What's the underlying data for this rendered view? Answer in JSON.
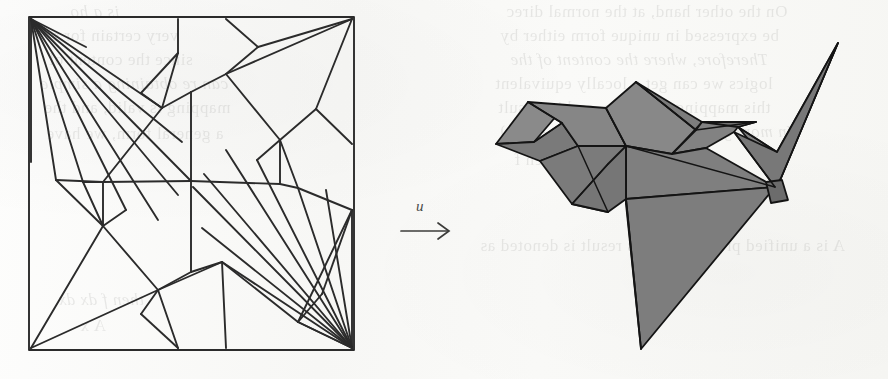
{
  "figure": {
    "kind": "origami-crease-pattern-and-folded-model",
    "caption": "",
    "arrow": {
      "label": "u",
      "direction": "right",
      "icon": "right-arrow-icon"
    },
    "colors": {
      "paper": "#fbfbfa",
      "crease_line": "#2b2b2b",
      "model_fill": "#7f7f7f",
      "model_fill_light": "#8c8c8c",
      "model_fill_dark": "#6f6f6f",
      "model_outline": "#141414",
      "ghost_text": "#5b5b58"
    },
    "left_panel": {
      "name": "crease-pattern",
      "shape": "square",
      "border_label": "paper boundary",
      "fan_vertices": [
        "top-left corner",
        "bottom-right corner"
      ],
      "fan_ray_count_top_left": 9,
      "fan_ray_count_bottom_right": 9,
      "viewbox": "0 0 331 339"
    },
    "right_panel": {
      "name": "folded-model",
      "subject": "flapping bird / crane",
      "facets_visible": 14,
      "viewbox": "0 0 418 358"
    }
  },
  "ghost_text": {
    "note": "faint show-through text from the reverse side of the scanned page (mirrored)",
    "lines": [
      {
        "text": "On the other hand, at the normal direc",
        "x": 506,
        "y": 2,
        "size": 17
      },
      {
        "text": "be expressed in unique form either by",
        "x": 500,
        "y": 26,
        "size": 17
      },
      {
        "text": "Therefore, where the content of the",
        "x": 510,
        "y": 50,
        "size": 17
      },
      {
        "text": "logics we can get a locally equivalent",
        "x": 495,
        "y": 74,
        "size": 17
      },
      {
        "text": "this mapping is unique, and its result",
        "x": 498,
        "y": 98,
        "size": 17
      },
      {
        "text": "In more general form, we have u = f (x)",
        "x": 500,
        "y": 122,
        "size": 17
      },
      {
        "text": "then  f",
        "x": 514,
        "y": 150,
        "size": 17
      },
      {
        "text": "A    is a unified process, and its result is denoted as",
        "x": 480,
        "y": 236,
        "size": 17
      },
      {
        "text": "is a ho",
        "x": 70,
        "y": 2,
        "size": 17
      },
      {
        "text": "very certain  for s",
        "x": 52,
        "y": 26,
        "size": 17
      },
      {
        "text": "since the content of",
        "x": 48,
        "y": 50,
        "size": 17
      },
      {
        "text": "can re obtaining a simple",
        "x": 40,
        "y": 74,
        "size": 17
      },
      {
        "text": "mapping is valid, and the",
        "x": 44,
        "y": 98,
        "size": 17
      },
      {
        "text": "a  general form, we have",
        "x": 46,
        "y": 124,
        "size": 17
      },
      {
        "text": "then    f  dx    dx",
        "x": 58,
        "y": 290,
        "size": 17
      },
      {
        "text": "A  x",
        "x": 80,
        "y": 316,
        "size": 17
      }
    ]
  }
}
